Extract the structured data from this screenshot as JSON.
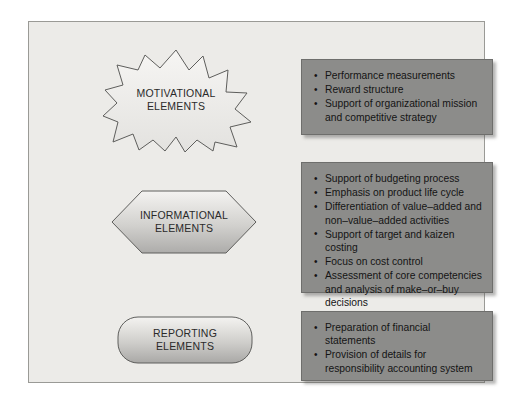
{
  "diagram": {
    "rows": [
      {
        "id": "motivational",
        "shape_kind": "starburst",
        "shape_label_line1": "MOTIVATIONAL",
        "shape_label_line2": "ELEMENTS",
        "bullets": [
          "Performance measurements",
          "Reward structure",
          "Support of organizational mission and competitive strategy"
        ]
      },
      {
        "id": "informational",
        "shape_kind": "hexagon",
        "shape_label_line1": "INFORMATIONAL",
        "shape_label_line2": "ELEMENTS",
        "bullets": [
          "Support of budgeting process",
          "Emphasis on product life cycle",
          "Differentiation of value–added and non–value–added activities",
          "Support of target and kaizen costing",
          "Focus on cost control",
          "Assessment of core competencies and analysis of make–or–buy decisions"
        ]
      },
      {
        "id": "reporting",
        "shape_kind": "rounded-rectangle",
        "shape_label_line1": "REPORTING",
        "shape_label_line2": "ELEMENTS",
        "bullets": [
          "Preparation of financial statements",
          "Provision of details for responsibility accounting system"
        ]
      }
    ],
    "colors": {
      "panel_background": "#ecebe8",
      "panel_border": "#9a9a96",
      "box_fill": "#8c8c8a",
      "box_border": "#6e6e6c",
      "box_text": "#141414",
      "shape_outline": "#5e5e5c",
      "shape_fill_light": "#f3f2f0",
      "shape_fill_dark": "#b5b4b1",
      "shape_text": "#2a2a2a"
    }
  }
}
